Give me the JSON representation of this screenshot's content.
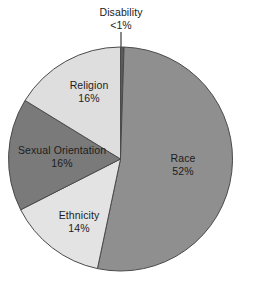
{
  "chart_data": {
    "type": "pie",
    "title": "",
    "subtitle": "",
    "xlabel": "",
    "ylabel": "",
    "legend": "none",
    "grid": false,
    "labels_inside": true,
    "start_angle_deg": 0,
    "direction": "clockwise",
    "categories": [
      "Disability",
      "Race",
      "Ethnicity",
      "Sexual Orientation",
      "Religion"
    ],
    "values": [
      0.5,
      52,
      14,
      16,
      16
    ],
    "value_labels": [
      "<1%",
      "52%",
      "14%",
      "16%",
      "16%"
    ],
    "colors": [
      "#5a5a5a",
      "#8f8f8f",
      "#e3e3e3",
      "#7a7a7a",
      "#dedede"
    ],
    "slices": [
      {
        "name": "Disability",
        "value": 0.5,
        "value_label": "<1%",
        "color": "#5a5a5a",
        "label_placement": "outside-top",
        "has_leader_line": true
      },
      {
        "name": "Race",
        "value": 52,
        "value_label": "52%",
        "color": "#8f8f8f",
        "label_placement": "inside",
        "has_leader_line": false
      },
      {
        "name": "Ethnicity",
        "value": 14,
        "value_label": "14%",
        "color": "#e3e3e3",
        "label_placement": "inside",
        "has_leader_line": false
      },
      {
        "name": "Sexual Orientation",
        "value": 16,
        "value_label": "16%",
        "color": "#7a7a7a",
        "label_placement": "inside",
        "has_leader_line": false
      },
      {
        "name": "Religion",
        "value": 16,
        "value_label": "16%",
        "color": "#dedede",
        "label_placement": "inside",
        "has_leader_line": false
      }
    ],
    "stroke_color": "#4a4a4a",
    "text_color": "#1c1c1c",
    "background": "#ffffff"
  }
}
